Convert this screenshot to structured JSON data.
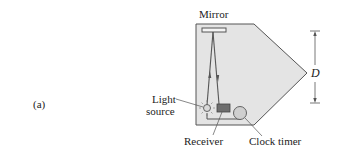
{
  "figure": {
    "panel_label": "(a)",
    "labels": {
      "mirror": "Mirror",
      "light_source_line1": "Light",
      "light_source_line2": "source",
      "receiver": "Receiver",
      "clock_timer": "Clock timer",
      "distance": "D"
    },
    "colors": {
      "panel_fill": "#e4e4e4",
      "panel_stroke": "#555555",
      "receiver_fill": "#6e6e6e",
      "clock_fill": "#cfcfcf",
      "beam": "#555555"
    }
  }
}
